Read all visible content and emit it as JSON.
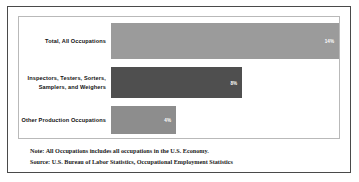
{
  "chart_data": {
    "type": "bar",
    "orientation": "horizontal",
    "title": "",
    "xlabel": "",
    "ylabel": "",
    "grid": false,
    "legend": false,
    "xlim": [
      0,
      16
    ],
    "categories": [
      "Total, All Occupations",
      "Inspectors, Testers, Sorters, Samplers, and Weighers",
      "Other Production Occupations"
    ],
    "values": [
      14,
      8,
      4
    ],
    "value_labels": [
      "14%",
      "8%",
      "4%"
    ],
    "colors": [
      "#9b9b9b",
      "#4f4f4f",
      "#8d8d8d"
    ]
  },
  "bars": [
    {
      "label": "Total, All Occupations",
      "value_label": "14%",
      "width_pct": 100
    },
    {
      "label": "Inspectors, Testers, Sorters, Samplers, and Weighers",
      "value_label": "8%",
      "width_pct": 57.5
    },
    {
      "label": "Other Production Occupations",
      "value_label": "4%",
      "width_pct": 28.5
    }
  ],
  "footnotes": {
    "note": "Note: All Occupations includes all occupations in the U.S. Economy.",
    "source": "Source: U.S. Bureau of Labor Statistics, Occupational Employment Statistics"
  }
}
